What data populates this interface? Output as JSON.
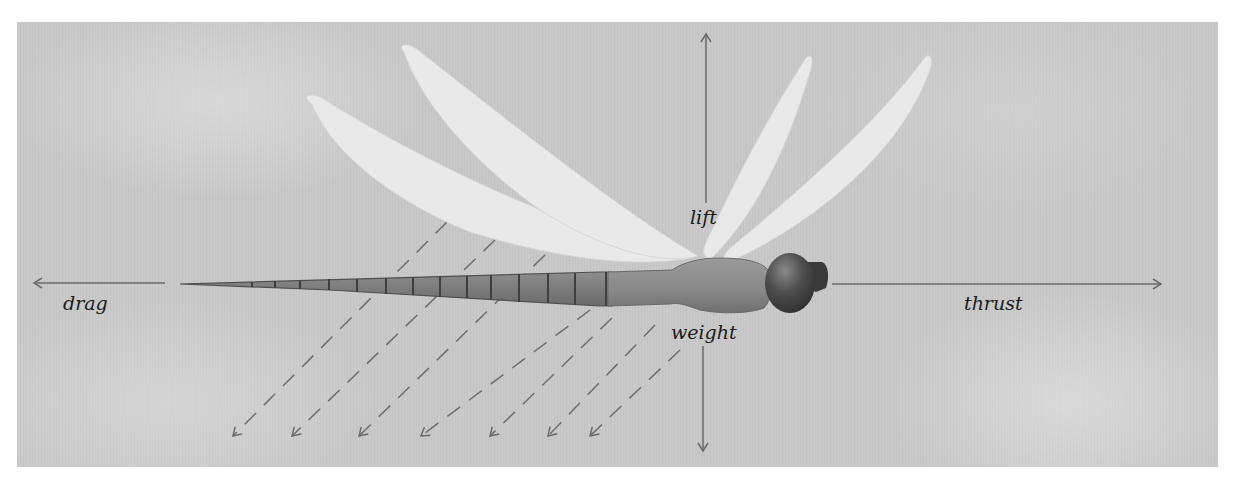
{
  "diagram": {
    "labels": {
      "lift": "lift",
      "weight": "weight",
      "drag": "drag",
      "thrust": "thrust"
    },
    "forces": [
      {
        "name": "lift",
        "direction": "up"
      },
      {
        "name": "weight",
        "direction": "down"
      },
      {
        "name": "drag",
        "direction": "left"
      },
      {
        "name": "thrust",
        "direction": "right"
      }
    ],
    "airflow_arrow_count": 7,
    "wing_count": 4,
    "colors": {
      "background_panel": "#c9c9c9",
      "page": "#ffffff",
      "wing": "#ececec",
      "body": "#8c8c8c",
      "abdomen": "#7e7e7e",
      "head": "#4a4a4a",
      "arrow": "#6e6e6e",
      "text": "#1a1a1a"
    }
  }
}
